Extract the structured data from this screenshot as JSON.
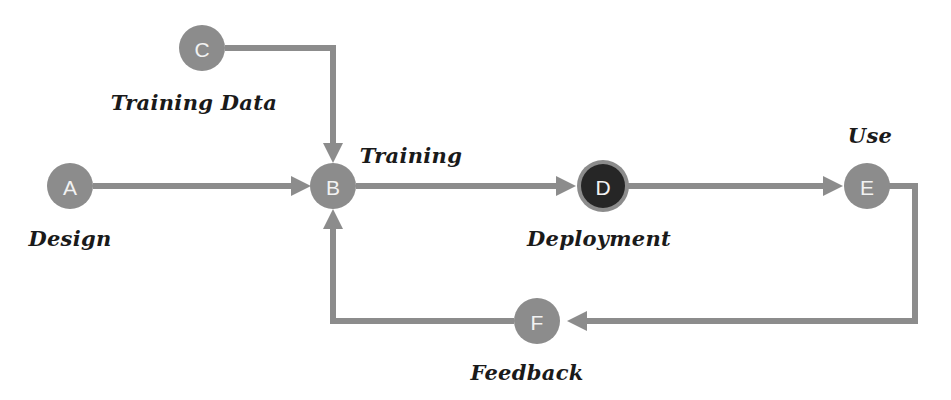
{
  "diagram": {
    "background_color": "#ffffff",
    "edge_color": "#8c8c8c",
    "node_fill_default": "#8c8c8c",
    "node_fill_dark": "#262626",
    "node_ring_color": "#8c8c8c",
    "node_text_color": "#f2f2f2",
    "label_text_color": "#1a1a1a",
    "nodes": [
      {
        "id": "A",
        "letter": "A",
        "label": "Design",
        "cx": 70,
        "cy": 186,
        "r": 23,
        "fill": "#8c8c8c",
        "ring": false,
        "label_x": 70,
        "label_y": 246
      },
      {
        "id": "C",
        "letter": "C",
        "label": "Training Data",
        "cx": 202,
        "cy": 48,
        "r": 23,
        "fill": "#8c8c8c",
        "ring": false,
        "label_x": 194,
        "label_y": 110
      },
      {
        "id": "B",
        "letter": "B",
        "label": "Training",
        "cx": 333,
        "cy": 186,
        "r": 23,
        "fill": "#8c8c8c",
        "ring": false,
        "label_x": 411,
        "label_y": 163
      },
      {
        "id": "D",
        "letter": "D",
        "label": "Deployment",
        "cx": 603,
        "cy": 186,
        "r": 25,
        "fill": "#262626",
        "ring": true,
        "label_x": 599,
        "label_y": 246
      },
      {
        "id": "E",
        "letter": "E",
        "label": "Use",
        "cx": 867,
        "cy": 186,
        "r": 23,
        "fill": "#8c8c8c",
        "ring": false,
        "label_x": 870,
        "label_y": 143
      },
      {
        "id": "F",
        "letter": "F",
        "label": "Feedback",
        "cx": 537,
        "cy": 321,
        "r": 23,
        "fill": "#8c8c8c",
        "ring": false,
        "label_x": 527,
        "label_y": 380
      }
    ],
    "edges": [
      {
        "id": "a-to-b",
        "name": "edge-design-to-training",
        "from": "A",
        "to": "B",
        "points": "93,186 303,186",
        "arrow": true,
        "arrow_dir": "right",
        "arrow_at": "303,186"
      },
      {
        "id": "c-to-b",
        "name": "edge-training-data-to-training",
        "from": "C",
        "to": "B",
        "points": "225,48 333,48 333,156",
        "arrow": true,
        "arrow_dir": "down",
        "arrow_at": "333,156"
      },
      {
        "id": "b-to-d",
        "name": "edge-training-to-deployment",
        "from": "B",
        "to": "D",
        "points": "356,186 572,186",
        "arrow": true,
        "arrow_dir": "right",
        "arrow_at": "572,186"
      },
      {
        "id": "d-to-e",
        "name": "edge-deployment-to-use",
        "from": "D",
        "to": "E",
        "points": "628,186 838,186",
        "arrow": true,
        "arrow_dir": "right",
        "arrow_at": "838,186"
      },
      {
        "id": "e-to-f",
        "name": "edge-use-to-feedback",
        "from": "E",
        "to": "F",
        "points": "890,186 915,186 915,321 567,321",
        "arrow": true,
        "arrow_dir": "left",
        "arrow_at": "567,321"
      },
      {
        "id": "f-to-b",
        "name": "edge-feedback-to-training",
        "from": "F",
        "to": "B",
        "points": "514,321 333,321 333,216",
        "arrow": true,
        "arrow_dir": "up",
        "arrow_at": "333,216"
      }
    ]
  }
}
